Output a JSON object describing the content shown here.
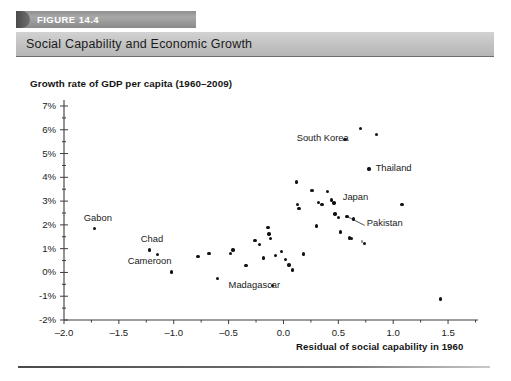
{
  "header": {
    "figure_label": "FIGURE 14.4",
    "title": "Social Capability and Economic Growth"
  },
  "chart_data": {
    "type": "scatter",
    "title": "Social Capability and Economic Growth",
    "ylabel": "Growth rate of GDP per capita (1960–2009)",
    "xlabel": "Residual of social capability in 1960",
    "xlim": [
      -2.0,
      1.7
    ],
    "ylim": [
      -2,
      7
    ],
    "grid": false,
    "legend": "none",
    "xticks": [
      "-2.0",
      "-1.5",
      "-1.0",
      "-0.5",
      "0.0",
      "0.5",
      "1.0",
      "1.5"
    ],
    "xtick_values": [
      -2.0,
      -1.5,
      -1.0,
      -0.5,
      0.0,
      0.5,
      1.0,
      1.5
    ],
    "yticks": [
      "7%",
      "6%",
      "5%",
      "4%",
      "3%",
      "2%",
      "1%",
      "0%",
      "-1%",
      "-2%"
    ],
    "ytick_values": [
      7,
      6,
      5,
      4,
      3,
      2,
      1,
      0,
      -1,
      -2
    ],
    "points": [
      {
        "x": -1.72,
        "y": 1.85,
        "label": "Gabon"
      },
      {
        "x": -1.22,
        "y": 0.95,
        "label": "Chad"
      },
      {
        "x": -1.15,
        "y": 0.75,
        "label": "Cameroon"
      },
      {
        "x": -1.02,
        "y": 0.02,
        "label": ""
      },
      {
        "x": -0.78,
        "y": 0.68,
        "label": ""
      },
      {
        "x": -0.68,
        "y": 0.8,
        "label": ""
      },
      {
        "x": -0.6,
        "y": -0.25,
        "label": "Madagascar"
      },
      {
        "x": -0.48,
        "y": 0.8,
        "label": ""
      },
      {
        "x": -0.46,
        "y": 0.95,
        "label": ""
      },
      {
        "x": -0.34,
        "y": 0.28,
        "label": ""
      },
      {
        "x": -0.26,
        "y": 1.35,
        "label": ""
      },
      {
        "x": -0.22,
        "y": 1.18,
        "label": ""
      },
      {
        "x": -0.18,
        "y": 0.6,
        "label": ""
      },
      {
        "x": -0.14,
        "y": 1.9,
        "label": ""
      },
      {
        "x": -0.13,
        "y": 1.62,
        "label": ""
      },
      {
        "x": -0.12,
        "y": 1.42,
        "label": ""
      },
      {
        "x": -0.1,
        "y": -0.55,
        "label": ""
      },
      {
        "x": -0.07,
        "y": 0.72,
        "label": ""
      },
      {
        "x": -0.02,
        "y": 0.88,
        "label": ""
      },
      {
        "x": 0.02,
        "y": 0.55,
        "label": ""
      },
      {
        "x": 0.05,
        "y": 0.32,
        "label": ""
      },
      {
        "x": 0.08,
        "y": 0.1,
        "label": ""
      },
      {
        "x": 0.12,
        "y": 3.8,
        "label": ""
      },
      {
        "x": 0.13,
        "y": 2.85,
        "label": ""
      },
      {
        "x": 0.14,
        "y": 2.7,
        "label": ""
      },
      {
        "x": 0.18,
        "y": 0.78,
        "label": ""
      },
      {
        "x": 0.26,
        "y": 3.45,
        "label": ""
      },
      {
        "x": 0.3,
        "y": 1.95,
        "label": ""
      },
      {
        "x": 0.32,
        "y": 2.95,
        "label": ""
      },
      {
        "x": 0.35,
        "y": 2.85,
        "label": ""
      },
      {
        "x": 0.4,
        "y": 3.4,
        "label": ""
      },
      {
        "x": 0.44,
        "y": 3.05,
        "label": ""
      },
      {
        "x": 0.46,
        "y": 2.92,
        "label": "Japan"
      },
      {
        "x": 0.47,
        "y": 2.45,
        "label": ""
      },
      {
        "x": 0.5,
        "y": 2.3,
        "label": ""
      },
      {
        "x": 0.52,
        "y": 1.7,
        "label": ""
      },
      {
        "x": 0.56,
        "y": 5.6,
        "label": "South Korea"
      },
      {
        "x": 0.58,
        "y": 2.35,
        "label": "Pakistan"
      },
      {
        "x": 0.6,
        "y": 1.45,
        "label": ""
      },
      {
        "x": 0.62,
        "y": 1.42,
        "label": ""
      },
      {
        "x": 0.64,
        "y": 2.25,
        "label": ""
      },
      {
        "x": 0.7,
        "y": 6.05,
        "label": ""
      },
      {
        "x": 0.72,
        "y": 1.28,
        "label": ""
      },
      {
        "x": 0.74,
        "y": 1.22,
        "label": ""
      },
      {
        "x": 0.78,
        "y": 4.35,
        "label": "Thailand"
      },
      {
        "x": 0.85,
        "y": 5.8,
        "label": ""
      },
      {
        "x": 1.08,
        "y": 2.85,
        "label": ""
      },
      {
        "x": 1.43,
        "y": -1.12,
        "label": ""
      }
    ],
    "annotations": [
      {
        "text": "Gabon",
        "x": -1.82,
        "y": 2.25
      },
      {
        "text": "Chad",
        "x": -1.3,
        "y": 1.35
      },
      {
        "text": "Cameroon",
        "x": -1.42,
        "y": 0.45
      },
      {
        "text": "Madagascar",
        "x": -0.5,
        "y": -0.55
      },
      {
        "text": "South Korea",
        "x": 0.12,
        "y": 5.6
      },
      {
        "text": "Thailand",
        "x": 0.84,
        "y": 4.35
      },
      {
        "text": "Japan",
        "x": 0.54,
        "y": 3.15
      },
      {
        "text": "Pakistan",
        "x": 0.76,
        "y": 2.05
      }
    ],
    "leader_lines": [
      {
        "from": {
          "x": 0.58,
          "y": 2.35
        },
        "to": {
          "x": 0.74,
          "y": 1.98
        }
      }
    ]
  },
  "colors": {
    "point": "#111111",
    "axis": "#3c3c3c",
    "header_bar": "#c3c3c3",
    "figure_tab": "#9a9a9a",
    "text": "#1a1a1a"
  }
}
